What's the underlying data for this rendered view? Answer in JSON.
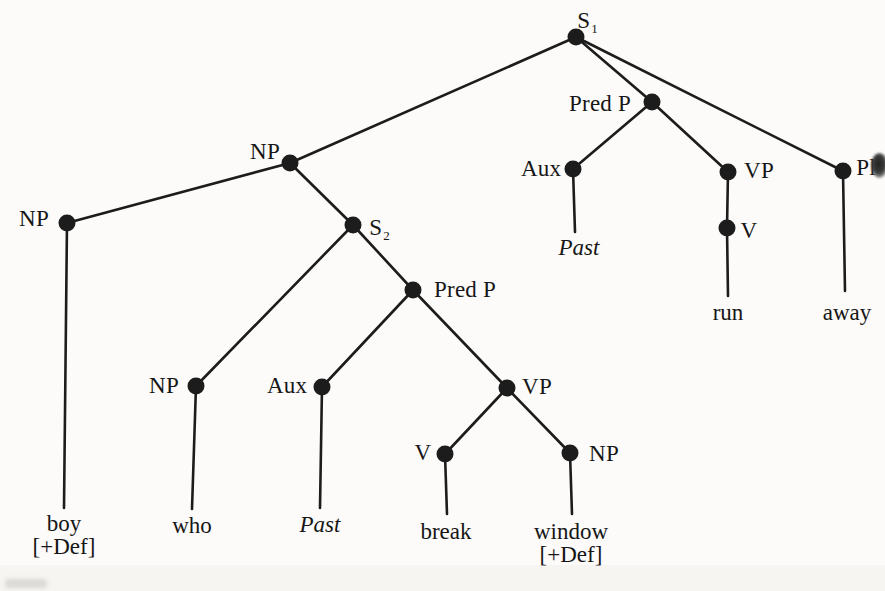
{
  "figure": {
    "type": "syntax-tree",
    "ink_color": "#1c1c1c",
    "background_color": "#fcfbf9",
    "dot_radius": 8.5,
    "line_width": 2.6
  },
  "tree": {
    "nodes": [
      {
        "id": "s1",
        "label": "S",
        "sub": "1",
        "x": 576,
        "y": 37,
        "lx": 587,
        "ly": 21
      },
      {
        "id": "np_subj",
        "label": "NP",
        "x": 290,
        "y": 163,
        "lx": 265,
        "ly": 152
      },
      {
        "id": "np_boy",
        "label": "NP",
        "x": 67,
        "y": 223,
        "lx": 34,
        "ly": 219
      },
      {
        "id": "s2",
        "label": "S",
        "sub": "2",
        "x": 353,
        "y": 225,
        "lx": 379,
        "ly": 228
      },
      {
        "id": "predp_top",
        "label": "Pred P",
        "x": 652,
        "y": 102,
        "lx": 600,
        "ly": 104
      },
      {
        "id": "aux_top",
        "label": "Aux",
        "x": 573,
        "y": 169,
        "lx": 541,
        "ly": 169
      },
      {
        "id": "vp_top",
        "label": "VP",
        "x": 728,
        "y": 172,
        "lx": 759,
        "ly": 171
      },
      {
        "id": "v_top",
        "label": "V",
        "x": 727,
        "y": 228,
        "lx": 749,
        "ly": 231
      },
      {
        "id": "pl",
        "label": "Pl",
        "x": 843,
        "y": 171,
        "lx": 866,
        "ly": 168
      },
      {
        "id": "np_who",
        "label": "NP",
        "x": 196,
        "y": 386,
        "lx": 164,
        "ly": 386
      },
      {
        "id": "aux_low",
        "label": "Aux",
        "x": 322,
        "y": 387,
        "lx": 287,
        "ly": 386
      },
      {
        "id": "predp_low",
        "label": "Pred P",
        "x": 413,
        "y": 290,
        "lx": 465,
        "ly": 290
      },
      {
        "id": "vp_low",
        "label": "VP",
        "x": 507,
        "y": 388,
        "lx": 537,
        "ly": 387
      },
      {
        "id": "v_low",
        "label": "V",
        "x": 445,
        "y": 454,
        "lx": 423,
        "ly": 453
      },
      {
        "id": "np_win",
        "label": "NP",
        "x": 570,
        "y": 453,
        "lx": 604,
        "ly": 454
      }
    ],
    "edges": [
      [
        "s1",
        "np_subj"
      ],
      [
        "s1",
        "predp_top"
      ],
      [
        "s1",
        "pl"
      ],
      [
        "np_subj",
        "np_boy"
      ],
      [
        "np_subj",
        "s2"
      ],
      [
        "s2",
        "np_who"
      ],
      [
        "s2",
        "predp_low"
      ],
      [
        "predp_low",
        "aux_low"
      ],
      [
        "predp_low",
        "vp_low"
      ],
      [
        "vp_low",
        "v_low"
      ],
      [
        "vp_low",
        "np_win"
      ],
      [
        "predp_top",
        "aux_top"
      ],
      [
        "predp_top",
        "vp_top"
      ],
      [
        "vp_top",
        "v_top"
      ]
    ],
    "drops": [
      {
        "from": "np_boy",
        "x2": 64,
        "y2": 508
      },
      {
        "from": "np_who",
        "x2": 192,
        "y2": 509
      },
      {
        "from": "aux_low",
        "x2": 320,
        "y2": 508
      },
      {
        "from": "v_low",
        "x2": 447,
        "y2": 514
      },
      {
        "from": "np_win",
        "x2": 572,
        "y2": 514
      },
      {
        "from": "aux_top",
        "x2": 575,
        "y2": 232
      },
      {
        "from": "v_top",
        "x2": 728,
        "y2": 296
      },
      {
        "from": "pl",
        "x2": 845,
        "y2": 291
      }
    ],
    "terminals": [
      {
        "id": "boy",
        "lines": [
          "boy",
          "[+Def]"
        ],
        "x": 64,
        "y": 535,
        "italic": false
      },
      {
        "id": "who",
        "lines": [
          "who"
        ],
        "x": 192,
        "y": 525,
        "italic": false
      },
      {
        "id": "past_low",
        "lines": [
          "Past"
        ],
        "x": 320,
        "y": 524,
        "italic": true
      },
      {
        "id": "break",
        "lines": [
          "break"
        ],
        "x": 446,
        "y": 531,
        "italic": false
      },
      {
        "id": "window",
        "lines": [
          "window",
          "[+Def]"
        ],
        "x": 571,
        "y": 543,
        "italic": false
      },
      {
        "id": "past_top",
        "lines": [
          "Past"
        ],
        "x": 579,
        "y": 247,
        "italic": true
      },
      {
        "id": "run",
        "lines": [
          "run"
        ],
        "x": 728,
        "y": 312,
        "italic": false
      },
      {
        "id": "away",
        "lines": [
          "away"
        ],
        "x": 847,
        "y": 312,
        "italic": false
      }
    ]
  }
}
